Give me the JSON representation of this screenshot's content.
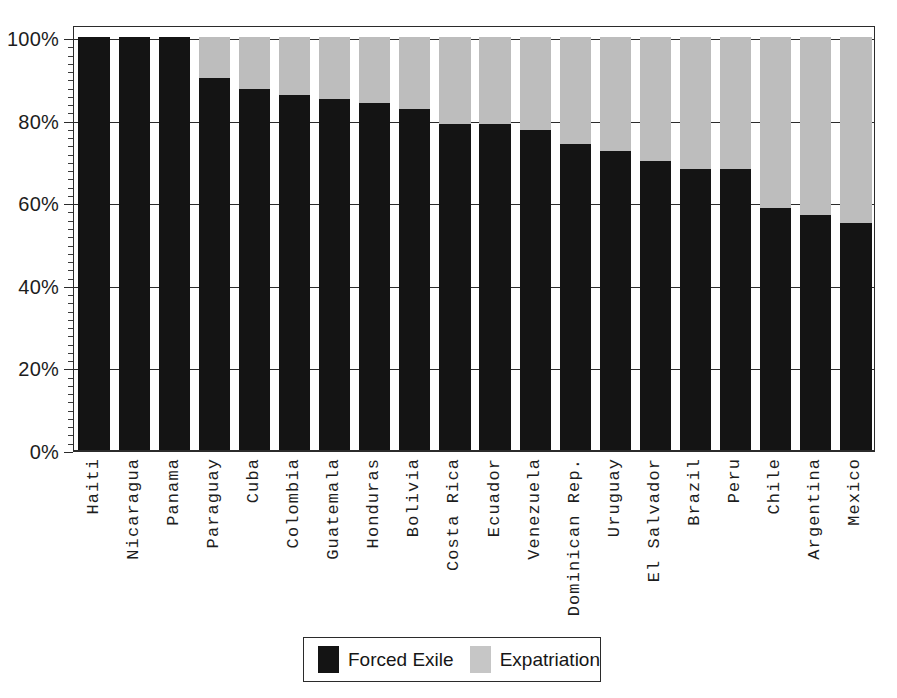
{
  "chart_data": {
    "type": "bar",
    "subtype": "stacked-100-percent",
    "title": "",
    "xlabel": "",
    "ylabel": "",
    "ylim": [
      0,
      100
    ],
    "ytick_labels": [
      "0%",
      "20%",
      "40%",
      "60%",
      "80%",
      "100%"
    ],
    "ytick_values": [
      0,
      20,
      40,
      60,
      80,
      100
    ],
    "gridlines": [
      20,
      40,
      60,
      80,
      100
    ],
    "grid": true,
    "minor_ticks": true,
    "legend_position": "bottom-center",
    "categories": [
      "Haiti",
      "Nicaragua",
      "Panama",
      "Paraguay",
      "Cuba",
      "Colombia",
      "Guatemala",
      "Honduras",
      "Bolivia",
      "Costa Rica",
      "Ecuador",
      "Venezuela",
      "Dominican Rep.",
      "Uruguay",
      "El Salvador",
      "Brazil",
      "Peru",
      "Chile",
      "Argentina",
      "Mexico"
    ],
    "series": [
      {
        "name": "Forced Exile",
        "color": "#141414",
        "values": [
          100,
          100,
          100,
          90,
          87.5,
          86,
          85,
          84,
          82.5,
          79,
          79,
          77.5,
          74,
          72.5,
          70,
          68,
          68,
          58.5,
          57,
          55
        ]
      },
      {
        "name": "Expatriation",
        "color": "#bdbdbd",
        "values": [
          0,
          0,
          0,
          10,
          12.5,
          14,
          15,
          16,
          17.5,
          21,
          21,
          22.5,
          26,
          27.5,
          30,
          32,
          32,
          41.5,
          43,
          45
        ]
      }
    ]
  },
  "legend": {
    "items": [
      {
        "label": "Forced Exile",
        "swatch": "black-swatch"
      },
      {
        "label": "Expatriation",
        "swatch": "gray-swatch"
      }
    ]
  },
  "colors": {
    "exile": "#141414",
    "expatriation": "#bdbdbd",
    "axis": "#2b2b2b",
    "background": "#ffffff"
  }
}
